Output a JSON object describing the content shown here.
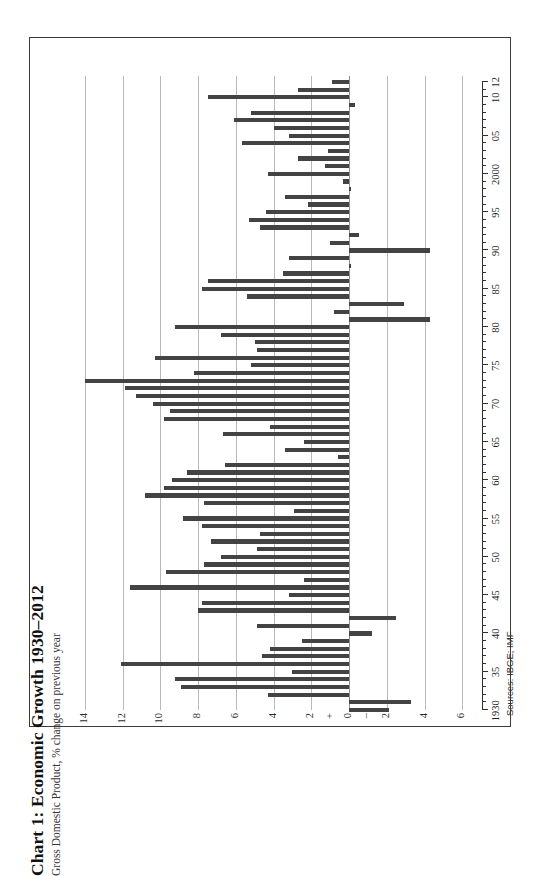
{
  "figure": {
    "title": "Chart 1: Economic Growth 1930–2012",
    "subtitle": "Gross Domestic Product, % change on previous year",
    "source": "Sources: IBGE; IMF",
    "frame_color": "#3a3a3a",
    "bar_color": "#434343",
    "grid_color": "#b9b9b9",
    "page_background": "#ffffff"
  },
  "chart_data": {
    "type": "bar",
    "orientation": "horizontal-printed-sideways",
    "title": "Chart 1: Economic Growth 1930–2012",
    "subtitle": "Gross Domestic Product, % change on previous year",
    "xlabel": "",
    "ylabel": "Gross Domestic Product, % change on previous year",
    "source": "Sources: IBGE; IMF",
    "grid": true,
    "legend": "none",
    "value_axis_labels": [
      "14",
      "12",
      "10",
      "8",
      "6",
      "4",
      "2",
      "+",
      "0",
      "–",
      "2",
      "4",
      "6"
    ],
    "value_axis_ticks": [
      14,
      12,
      10,
      8,
      6,
      4,
      2,
      0,
      -2,
      -4,
      -6
    ],
    "ylim": [
      -6,
      15
    ],
    "year_axis_labels": [
      "1930",
      "35",
      "40",
      "45",
      "50",
      "55",
      "60",
      "65",
      "70",
      "75",
      "80",
      "85",
      "90",
      "95",
      "2000",
      "05",
      "10",
      "12"
    ],
    "year_axis_label_values": [
      1930,
      1935,
      1940,
      1945,
      1950,
      1955,
      1960,
      1965,
      1970,
      1975,
      1980,
      1985,
      1990,
      1995,
      2000,
      2005,
      2010,
      2012
    ],
    "xlim": [
      1929.2,
      2012.8
    ],
    "categories": [
      1930,
      1931,
      1932,
      1933,
      1934,
      1935,
      1936,
      1937,
      1938,
      1939,
      1940,
      1941,
      1942,
      1943,
      1944,
      1945,
      1946,
      1947,
      1948,
      1949,
      1950,
      1951,
      1952,
      1953,
      1954,
      1955,
      1956,
      1957,
      1958,
      1959,
      1960,
      1961,
      1962,
      1963,
      1964,
      1965,
      1966,
      1967,
      1968,
      1969,
      1970,
      1971,
      1972,
      1973,
      1974,
      1975,
      1976,
      1977,
      1978,
      1979,
      1980,
      1981,
      1982,
      1983,
      1984,
      1985,
      1986,
      1987,
      1988,
      1989,
      1990,
      1991,
      1992,
      1993,
      1994,
      1995,
      1996,
      1997,
      1998,
      1999,
      2000,
      2001,
      2002,
      2003,
      2004,
      2005,
      2006,
      2007,
      2008,
      2009,
      2010,
      2011,
      2012
    ],
    "values": [
      -2.1,
      -3.3,
      4.3,
      8.9,
      9.2,
      3.0,
      12.1,
      4.6,
      4.2,
      2.5,
      -1.2,
      4.9,
      -2.5,
      8.0,
      7.8,
      3.2,
      11.6,
      2.4,
      9.7,
      7.7,
      6.8,
      4.9,
      7.3,
      4.7,
      7.8,
      8.8,
      2.9,
      7.7,
      10.8,
      9.8,
      9.4,
      8.6,
      6.6,
      0.6,
      3.4,
      2.4,
      6.7,
      4.2,
      9.8,
      9.5,
      10.4,
      11.3,
      11.9,
      14.0,
      8.2,
      5.2,
      10.3,
      4.9,
      5.0,
      6.8,
      9.2,
      -4.3,
      0.8,
      -2.9,
      5.4,
      7.8,
      7.5,
      3.5,
      -0.1,
      3.2,
      -4.3,
      1.0,
      -0.5,
      4.7,
      5.3,
      4.4,
      2.2,
      3.4,
      0.0,
      0.3,
      4.3,
      1.3,
      2.7,
      1.1,
      5.7,
      3.2,
      4.0,
      6.1,
      5.2,
      -0.3,
      7.5,
      2.7,
      0.9
    ]
  },
  "axes": {
    "value_axis_title": "%",
    "zero_marker_positive": "+",
    "zero_marker_negative": "–"
  }
}
